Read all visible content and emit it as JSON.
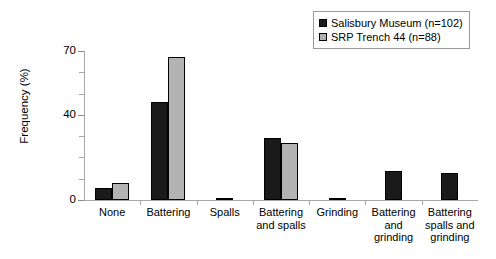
{
  "chart_data": {
    "type": "bar",
    "title": "",
    "xlabel": "",
    "ylabel": "Frequency (%)",
    "ylim": [
      0,
      70
    ],
    "yticks": [
      0,
      10,
      20,
      30,
      40,
      50,
      60,
      70
    ],
    "ytick_labels_shown": [
      "0",
      "40",
      "70"
    ],
    "grid": false,
    "legend_position": "top-right",
    "categories": [
      "None",
      "Battering",
      "Spalls",
      "Battering and spalls",
      "Grinding",
      "Battering and grinding",
      "Battering spalls and grinding"
    ],
    "category_label_lines": [
      [
        "None"
      ],
      [
        "Battering"
      ],
      [
        "Spalls"
      ],
      [
        "Battering",
        "and spalls"
      ],
      [
        "Grinding"
      ],
      [
        "Battering",
        "and",
        "grinding"
      ],
      [
        "Battering",
        "spalls and",
        "grinding"
      ]
    ],
    "series": [
      {
        "name": "Salisbury Museum (n=102)",
        "color": "#1a1a1a",
        "values": [
          5.5,
          46,
          1,
          29,
          1,
          13.5,
          12.5
        ]
      },
      {
        "name": "SRP Trench 44 (n=88)",
        "color": "#b3b3b3",
        "values": [
          8,
          67,
          0,
          27,
          0,
          0,
          0
        ]
      }
    ]
  },
  "axis": {
    "y_label": "Frequency (%)",
    "y_max_label": "70",
    "y_mid_label": "40",
    "y_min_label": "0"
  },
  "legend": {
    "items": [
      {
        "label": "Salisbury Museum (n=102)",
        "swatch": "dark"
      },
      {
        "label": "SRP Trench 44 (n=88)",
        "swatch": "light"
      }
    ]
  }
}
